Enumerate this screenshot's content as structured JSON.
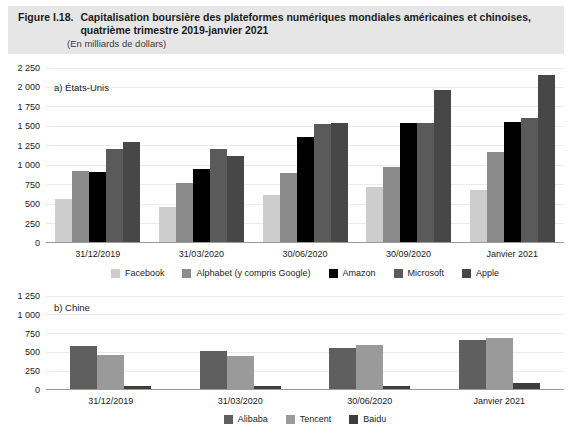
{
  "figure": {
    "number": "Figure I.18.",
    "title": "Capitalisation boursière des plateformes numériques mondiales américaines et chinoises, quatrième trimestre 2019-janvier 2021",
    "subtitle": "(En milliards de dollars)"
  },
  "chart_data": [
    {
      "type": "bar",
      "panel_id": "a",
      "title": "a) États-Unis",
      "xlabel": "",
      "ylabel": "",
      "ylim": [
        0,
        2250
      ],
      "yticks": [
        0,
        250,
        500,
        750,
        1000,
        1250,
        1500,
        1750,
        2000,
        2250
      ],
      "ytick_labels": [
        "0",
        "250",
        "500",
        "750",
        "1 000",
        "1 250",
        "1 500",
        "1 750",
        "2 000",
        "2 250"
      ],
      "grid": true,
      "legend_position": "bottom",
      "categories": [
        "31/12/2019",
        "31/03/2020",
        "30/06/2020",
        "30/09/2020",
        "Janvier 2021"
      ],
      "series": [
        {
          "name": "Facebook",
          "color": "#cdcdcd",
          "values": [
            550,
            450,
            600,
            710,
            670
          ]
        },
        {
          "name": "Alphabet (y compris Google)",
          "color": "#8b8b8b",
          "values": [
            910,
            760,
            890,
            960,
            1160
          ]
        },
        {
          "name": "Amazon",
          "color": "#000000",
          "values": [
            900,
            940,
            1350,
            1530,
            1540
          ]
        },
        {
          "name": "Microsoft",
          "color": "#5a5a5a",
          "values": [
            1200,
            1190,
            1520,
            1530,
            1600
          ]
        },
        {
          "name": "Apple",
          "color": "#474747",
          "values": [
            1290,
            1110,
            1530,
            1960,
            2150
          ]
        }
      ]
    },
    {
      "type": "bar",
      "panel_id": "b",
      "title": "b) Chine",
      "xlabel": "",
      "ylabel": "",
      "ylim": [
        0,
        1250
      ],
      "yticks": [
        0,
        250,
        500,
        750,
        1000,
        1250
      ],
      "ytick_labels": [
        "0",
        "250",
        "500",
        "750",
        "1 000",
        "1 250"
      ],
      "grid": true,
      "legend_position": "bottom",
      "categories": [
        "31/12/2019",
        "31/03/2020",
        "30/06/2020",
        "Janvier 2021"
      ],
      "series": [
        {
          "name": "Alibaba",
          "color": "#5f5f5f",
          "values": [
            570,
            500,
            550,
            650
          ]
        },
        {
          "name": "Tencent",
          "color": "#9a9a9a",
          "values": [
            450,
            440,
            580,
            680
          ]
        },
        {
          "name": "Baidu",
          "color": "#3d3d3d",
          "values": [
            40,
            35,
            40,
            75
          ]
        }
      ]
    }
  ]
}
